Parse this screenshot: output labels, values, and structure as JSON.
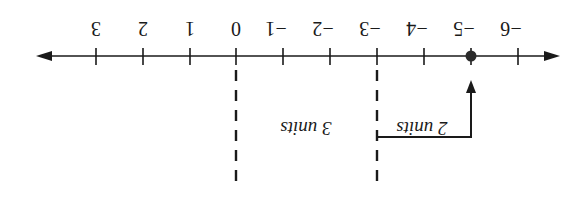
{
  "diagram": {
    "type": "number-line",
    "orientation": "rotated 180 degrees",
    "tick_labels": [
      "3",
      "2",
      "1",
      "0",
      "−1",
      "−2",
      "−3",
      "−4",
      "−5",
      "−6"
    ],
    "highlighted_point": "−5",
    "dashed_markers": [
      "0",
      "−3"
    ],
    "annotations": {
      "three_units": "3 units",
      "two_units": "2 units"
    },
    "colors": {
      "ink": "#1a1a1a",
      "background": "#ffffff"
    }
  }
}
